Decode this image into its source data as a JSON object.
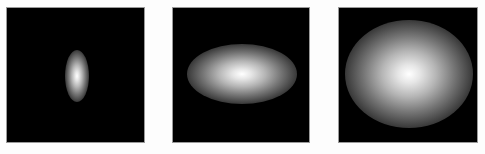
{
  "figure": {
    "background": "#fdfdfd",
    "panel_background": "#000000",
    "panels": [
      {
        "id": "panel-1",
        "shape": "vertical-ellipse",
        "left": 6,
        "width": 139,
        "blob": {
          "cx": 70,
          "cy": 68,
          "rx": 12,
          "ry": 26
        }
      },
      {
        "id": "panel-2",
        "shape": "horizontal-ellipse",
        "left": 172,
        "width": 138,
        "blob": {
          "cx": 69,
          "cy": 66,
          "rx": 55,
          "ry": 30
        }
      },
      {
        "id": "panel-3",
        "shape": "wide-ellipse",
        "left": 338,
        "width": 140,
        "blob": {
          "cx": 70,
          "cy": 66,
          "rx": 64,
          "ry": 54
        }
      }
    ]
  }
}
